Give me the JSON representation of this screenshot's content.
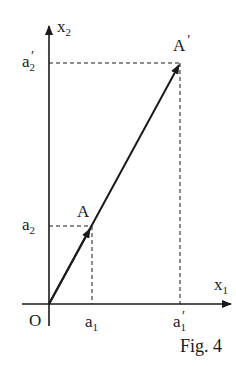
{
  "figure": {
    "caption": "Fig. 4",
    "axes": {
      "x_label": "x",
      "x_sub": "1",
      "y_label": "x",
      "y_sub": "2",
      "origin_label": "O"
    },
    "points": {
      "A": {
        "label": "A",
        "x_tick": "a",
        "x_tick_sub": "1",
        "y_tick": "a",
        "y_tick_sub": "2"
      },
      "A_prime": {
        "label": "A",
        "prime": "′",
        "x_tick": "a",
        "x_tick_sub": "1",
        "x_tick_prime": "′",
        "y_tick": "a",
        "y_tick_sub": "2",
        "y_tick_prime": "′"
      }
    },
    "colors": {
      "ink": "#1a1a1a",
      "background": "#ffffff"
    }
  }
}
